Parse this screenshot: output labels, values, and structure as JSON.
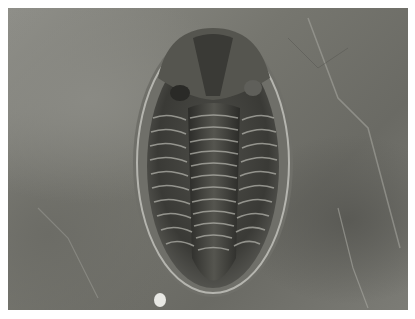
{
  "image": {
    "subject": "trilobite fossil",
    "description": "Black-and-white photograph of a trilobite fossil embedded in rock",
    "colors": {
      "background": "#ffffff",
      "rock_light": "#8f8f89",
      "rock_dark": "#5a5a55",
      "fossil_dark": "#2e2e2b",
      "fossil_mid": "#4a4a46",
      "highlight": "#b8b8b2"
    }
  }
}
